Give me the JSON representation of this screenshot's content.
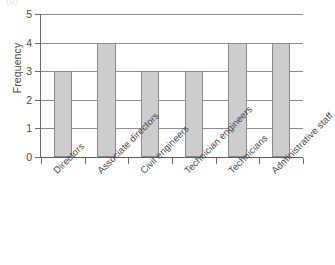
{
  "figure": {
    "tag": "(b)"
  },
  "chart_data": {
    "type": "bar",
    "title": "",
    "xlabel": "",
    "ylabel": "Frequency",
    "ylim": [
      0,
      5
    ],
    "ytick_labels": [
      "0",
      "1",
      "2",
      "3",
      "4",
      "5"
    ],
    "grid": true,
    "legend": false,
    "orientation": "vertical",
    "bar_color": "#cdcdcd",
    "bar_edge_color": "#8a8a8a",
    "categories": [
      "Directors",
      "Associate directors",
      "Civil engineers",
      "Technician engineers",
      "Technicians",
      "Administrative staff"
    ],
    "values": [
      3,
      4,
      3,
      3,
      4,
      4
    ]
  }
}
